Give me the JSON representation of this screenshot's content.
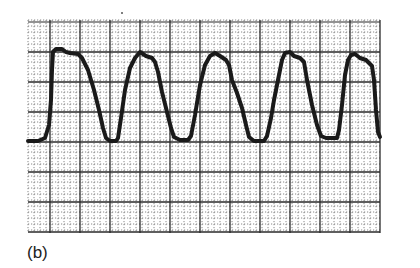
{
  "figure": {
    "panel_label": "(b)",
    "ink_color": "#1a1a1a",
    "grid_color_major": "#2a2a2a",
    "grid_color_minor": "#6a6a6a",
    "background": "#ffffff"
  },
  "chart_data": {
    "type": "line",
    "title": "",
    "xlabel": "",
    "ylabel": "",
    "grid": true,
    "legend": null,
    "grid_px": {
      "left": 28,
      "top": 20,
      "right": 380,
      "bottom": 233,
      "major": 30,
      "minor": 6
    },
    "xlim": [
      0,
      12
    ],
    "ylim": [
      0,
      7
    ],
    "units_note": "axis in major grid divisions (no tick labels shown)",
    "series": [
      {
        "name": "trace",
        "points_px": [
          [
            28,
            141
          ],
          [
            38,
            141
          ],
          [
            45,
            138
          ],
          [
            49,
            125
          ],
          [
            51,
            100
          ],
          [
            52,
            70
          ],
          [
            53,
            52
          ],
          [
            56,
            49
          ],
          [
            62,
            49
          ],
          [
            66,
            52
          ],
          [
            70,
            53
          ],
          [
            78,
            54
          ],
          [
            82,
            58
          ],
          [
            88,
            70
          ],
          [
            94,
            90
          ],
          [
            99,
            110
          ],
          [
            103,
            128
          ],
          [
            106,
            138
          ],
          [
            110,
            141
          ],
          [
            116,
            141
          ],
          [
            118,
            138
          ],
          [
            121,
            118
          ],
          [
            125,
            90
          ],
          [
            130,
            68
          ],
          [
            135,
            58
          ],
          [
            140,
            52
          ],
          [
            146,
            56
          ],
          [
            152,
            58
          ],
          [
            155,
            62
          ],
          [
            158,
            72
          ],
          [
            162,
            92
          ],
          [
            167,
            112
          ],
          [
            171,
            128
          ],
          [
            174,
            137
          ],
          [
            180,
            140
          ],
          [
            188,
            140
          ],
          [
            191,
            136
          ],
          [
            195,
            115
          ],
          [
            200,
            85
          ],
          [
            205,
            65
          ],
          [
            210,
            56
          ],
          [
            215,
            53
          ],
          [
            220,
            56
          ],
          [
            226,
            60
          ],
          [
            229,
            65
          ],
          [
            232,
            80
          ],
          [
            237,
            93
          ],
          [
            242,
            108
          ],
          [
            246,
            125
          ],
          [
            249,
            137
          ],
          [
            254,
            141
          ],
          [
            264,
            141
          ],
          [
            267,
            136
          ],
          [
            271,
            118
          ],
          [
            274,
            100
          ],
          [
            278,
            80
          ],
          [
            282,
            60
          ],
          [
            285,
            53
          ],
          [
            290,
            52
          ],
          [
            294,
            56
          ],
          [
            300,
            58
          ],
          [
            304,
            62
          ],
          [
            307,
            80
          ],
          [
            312,
            105
          ],
          [
            317,
            125
          ],
          [
            321,
            136
          ],
          [
            326,
            138
          ],
          [
            337,
            138
          ],
          [
            339,
            130
          ],
          [
            342,
            105
          ],
          [
            345,
            75
          ],
          [
            348,
            60
          ],
          [
            351,
            55
          ],
          [
            355,
            54
          ],
          [
            360,
            58
          ],
          [
            366,
            60
          ],
          [
            372,
            66
          ],
          [
            374,
            80
          ],
          [
            376,
            110
          ],
          [
            378,
            132
          ],
          [
            380,
            137
          ]
        ],
        "approx_values_divisions": {
          "baseline": 0.0,
          "peak_levels": [
            3.0,
            2.9,
            2.9,
            2.9,
            2.9
          ],
          "peak_x": [
            1.0,
            3.7,
            6.2,
            8.7,
            10.8
          ],
          "valley_x": [
            2.9,
            5.3,
            7.7,
            10.1
          ]
        }
      }
    ]
  }
}
